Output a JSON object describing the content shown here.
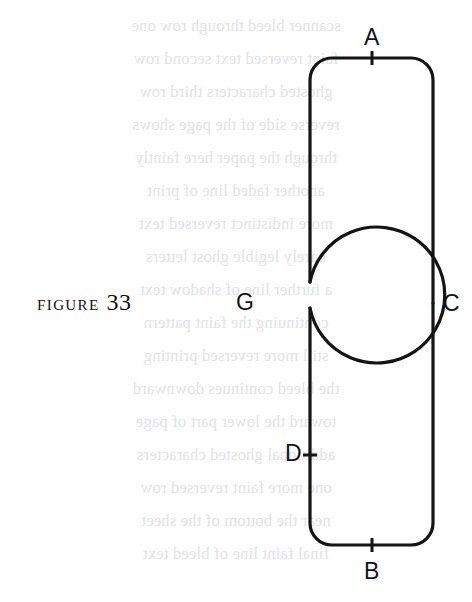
{
  "page": {
    "width": 472,
    "height": 602,
    "background_color": "#fefefe",
    "ink_color": "#141414"
  },
  "caption": {
    "word": "FIGURE",
    "number": "33"
  },
  "figure": {
    "name": "figure-33-loop-and-track-diagram",
    "stroke_color": "#141414",
    "stroke_width": 3.2,
    "fill": "none",
    "track": {
      "name": "rounded-track",
      "left": 310,
      "right": 433,
      "top": 58,
      "bottom": 545,
      "corner_radius": 22,
      "left_gap_top": 282,
      "left_gap_bottom": 308
    },
    "loop": {
      "name": "circular-loop",
      "center_x": 245,
      "center_y": 303,
      "radius": 68
    }
  },
  "labels": [
    {
      "id": "A",
      "text": "A",
      "x": 364,
      "y": 26,
      "name": "point-label-a"
    },
    {
      "id": "C",
      "text": "C",
      "x": 443,
      "y": 292,
      "name": "point-label-c"
    },
    {
      "id": "G",
      "text": "G",
      "x": 236,
      "y": 291,
      "name": "point-label-g"
    },
    {
      "id": "D",
      "text": "D",
      "x": 285,
      "y": 442,
      "name": "point-label-d"
    },
    {
      "id": "B",
      "text": "B",
      "x": 364,
      "y": 560,
      "name": "point-label-b"
    }
  ],
  "tick_marks": [
    {
      "id": "A",
      "x": 372,
      "y": 58,
      "orientation": "vertical",
      "length": 13
    },
    {
      "id": "D",
      "x": 310,
      "y": 455,
      "orientation": "horizontal",
      "length": 13
    },
    {
      "id": "B",
      "x": 372,
      "y": 545,
      "orientation": "vertical",
      "length": 13
    }
  ],
  "bleed_through_lines": [
    "scanner bleed through row one",
    "faint reversed text second row",
    "ghosted characters third row",
    "reverse side of the page shows",
    "through the paper here faintly",
    "another faded line of print",
    "more indistinct reversed text",
    "barely legible ghost letters",
    "a further line of shadow text",
    "continuing the faint pattern",
    "still more reversed printing",
    "the bleed continues downward",
    "toward the lower part of page",
    "additional ghosted characters",
    "one more faint reversed row",
    "near the bottom of the sheet",
    "final faint line of bleed text"
  ]
}
